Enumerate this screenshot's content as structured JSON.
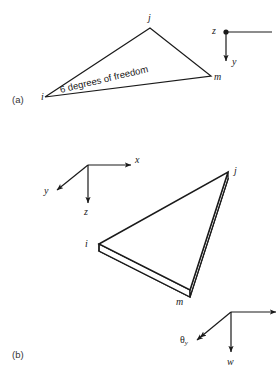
{
  "figure": {
    "stroke_color": "#1a1a1a",
    "fill_color": "#ffffff",
    "background": "#ffffff"
  },
  "panel_a": {
    "tag": "(a)",
    "annotation": "6 degrees of freedom",
    "annotation_rotation_deg": -13.5,
    "nodes": [
      {
        "id": "i",
        "label": "i",
        "x": 45,
        "y": 97
      },
      {
        "id": "j",
        "label": "j",
        "x": 150,
        "y": 20
      },
      {
        "id": "m",
        "label": "m",
        "x": 213,
        "y": 78
      }
    ],
    "triangle_points": "45,97 150,28 211,76",
    "axes": {
      "origin": {
        "x": 226,
        "y": 32
      },
      "items": [
        {
          "name": "z",
          "label": "z",
          "direction": "out-of-page-dot",
          "label_x": 213,
          "label_y": 27
        },
        {
          "name": "y",
          "label": "y",
          "direction": "down",
          "label_x": 233,
          "label_y": 63
        },
        {
          "name": "unlabeled-horizontal",
          "label": "",
          "direction": "right"
        }
      ]
    }
  },
  "panel_b": {
    "tag": "(b)",
    "nodes": [
      {
        "id": "i",
        "label": "i",
        "x": 87,
        "y": 245
      },
      {
        "id": "j",
        "label": "j",
        "x": 233,
        "y": 172
      },
      {
        "id": "m",
        "label": "m",
        "x": 176,
        "y": 302
      }
    ],
    "plate": {
      "top_face": "99,244 228,172 190,290",
      "thickness_px": 7
    },
    "axes": {
      "origin": {
        "x": 88,
        "y": 165
      },
      "items": [
        {
          "name": "x",
          "label": "x",
          "direction": "right",
          "label_x": 136,
          "label_y": 160
        },
        {
          "name": "y",
          "label": "y",
          "direction": "down-left",
          "label_x": 43,
          "label_y": 190
        },
        {
          "name": "z",
          "label": "z",
          "direction": "down",
          "label_x": 84,
          "label_y": 210
        }
      ]
    },
    "dof_indicator": {
      "origin": {
        "x": 231,
        "y": 312
      },
      "items": [
        {
          "name": "theta-y",
          "label": "θ",
          "subscript": "y",
          "direction": "down-left",
          "arrow": "double",
          "label_x": 182,
          "label_y": 339
        },
        {
          "name": "w",
          "label": "w",
          "direction": "down",
          "arrow": "single",
          "label_x": 228,
          "label_y": 363
        },
        {
          "name": "theta-x",
          "label": "",
          "direction": "right",
          "arrow": "single"
        }
      ]
    }
  }
}
